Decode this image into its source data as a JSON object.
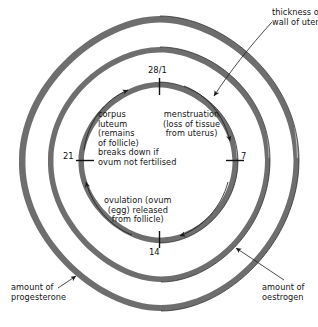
{
  "diagram": {
    "type": "concentric-ring-cycle",
    "background_color": "#ffffff",
    "ring_color": "#6b6b6b",
    "line_color": "#1a1a1a",
    "text_color": "#141414"
  },
  "day_markers": [
    {
      "id": "day-28-1",
      "label": "28/1",
      "position": "top",
      "angle_deg": 270
    },
    {
      "id": "day-7",
      "label": "7",
      "position": "right",
      "angle_deg": 0
    },
    {
      "id": "day-14",
      "label": "14",
      "position": "bottom",
      "angle_deg": 90
    },
    {
      "id": "day-21",
      "label": "21",
      "position": "left",
      "angle_deg": 180
    }
  ],
  "inner_labels": {
    "corpus_luteum": "corpus\nluteum\n(remains\nof follicle)\nbreaks down if\novum not fertilised",
    "menstruation": "menstruation\n(loss of tissue\nfrom uterus)",
    "ovulation": "ovulation (ovum\n(egg) released\nfrom follicle)"
  },
  "callouts": {
    "thickness_of_wall_of_uterus": "thickness of\nwall of uterus",
    "amount_of_progesterone": "amount of\nprogesterone",
    "amount_of_oestrogen": "amount of\noestrogen"
  },
  "rings": [
    {
      "id": "outer-ring",
      "name": "progesterone-ring",
      "meaning": "amount of progesterone"
    },
    {
      "id": "middle-ring",
      "name": "oestrogen-ring",
      "meaning": "amount of oestrogen"
    },
    {
      "id": "inner-ring",
      "name": "uterus-wall-ring",
      "meaning": "thickness of wall of uterus"
    }
  ],
  "flow_direction": "clockwise"
}
